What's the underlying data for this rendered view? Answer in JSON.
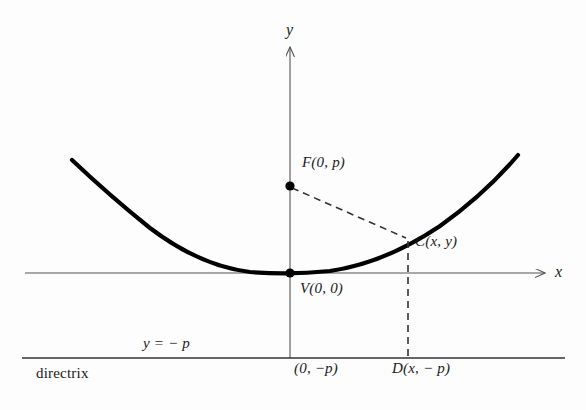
{
  "figure": {
    "background_color": "#fdfdfd",
    "curve_color": "#000000",
    "axis_color": "#555555",
    "dash_color": "#333333"
  },
  "axes": {
    "x_label": "x",
    "y_label": "y",
    "x_axis": {
      "x1": 25,
      "y1": 273,
      "x2": 545,
      "y2": 273
    },
    "y_axis": {
      "x1": 290,
      "y1": 47,
      "x2": 290,
      "y2": 358
    }
  },
  "points": {
    "focus": {
      "label": "F(0, p)",
      "x": 290,
      "y": 186,
      "label_x": 302,
      "label_y": 155
    },
    "vertex": {
      "label": "V(0, 0)",
      "x": 290,
      "y": 273,
      "label_x": 300,
      "label_y": 281
    },
    "curve_point": {
      "label": "C(x, y)",
      "x": 408,
      "y": 239,
      "label_x": 415,
      "label_y": 235
    },
    "directrix_point": {
      "label": "D(x, − p)",
      "x": 408,
      "y": 358,
      "label_x": 392,
      "label_y": 360
    },
    "directrix_origin": {
      "label": "(0, −p)",
      "x": 290,
      "y": 358,
      "label_x": 294,
      "label_y": 360
    }
  },
  "directrix": {
    "name_label": "directrix",
    "equation_label": "y = − p",
    "line": {
      "x1": 22,
      "y1": 358,
      "x2": 565,
      "y2": 358
    },
    "name_label_x": 36,
    "name_label_y": 366,
    "equation_label_x": 143,
    "equation_label_y": 336
  },
  "parabola": {
    "path": "M 72,160 Q 110,196 150,228 Q 200,266 250,272 Q 290,275 330,271 Q 385,263 440,226 Q 485,194 518,155",
    "left_end_x": 72,
    "left_end_y": 160,
    "right_end_x": 518,
    "right_end_y": 155,
    "vertex_x": 290,
    "vertex_y": 273
  },
  "dashed_segments": {
    "focus_to_point": {
      "x1": 292,
      "y1": 188,
      "x2": 406,
      "y2": 238
    },
    "point_to_directrix": {
      "x1": 408,
      "y1": 241,
      "x2": 408,
      "y2": 357
    }
  }
}
